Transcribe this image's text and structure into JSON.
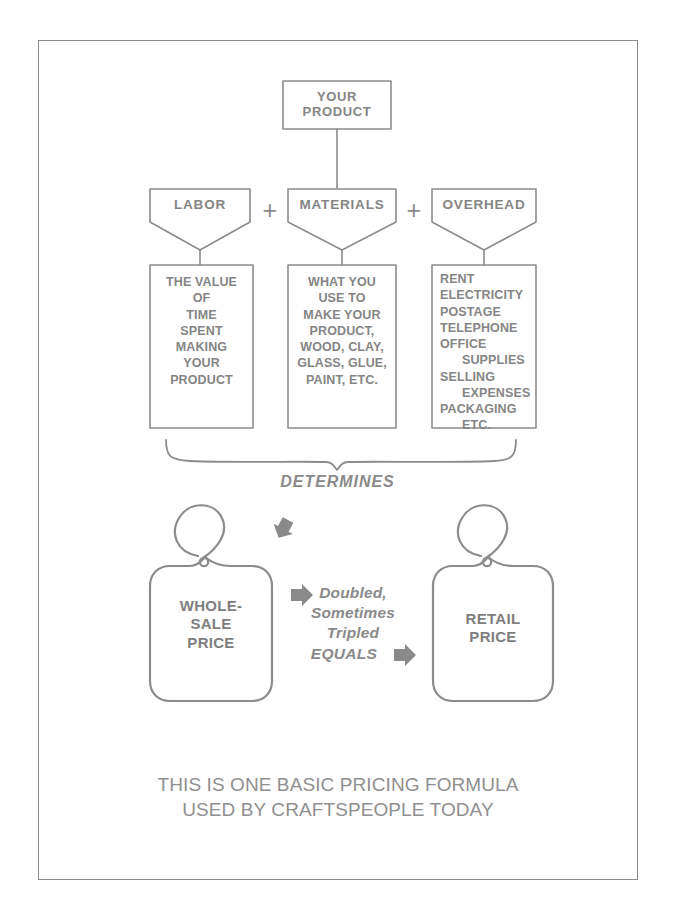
{
  "diagram": {
    "title_box": {
      "label": "YOUR\nPRODUCT",
      "line1": "YOUR",
      "line2": "PRODUCT"
    },
    "operators": {
      "plus1": "+",
      "plus2": "+"
    },
    "categories": [
      {
        "name": "LABOR",
        "detail_lines": [
          "THE VALUE",
          "OF",
          "TIME",
          "SPENT",
          "MAKING",
          "YOUR",
          "PRODUCT"
        ],
        "align": "center"
      },
      {
        "name": "MATERIALS",
        "detail_lines": [
          "WHAT YOU",
          "USE TO",
          "MAKE YOUR",
          "PRODUCT,",
          "WOOD, CLAY,",
          "GLASS, GLUE,",
          "PAINT, ETC."
        ],
        "align": "center"
      },
      {
        "name": "OVERHEAD",
        "detail_lines": [
          "RENT",
          "ELECTRICITY",
          "POSTAGE",
          "TELEPHONE",
          "OFFICE",
          "   SUPPLIES",
          "SELLING",
          "   EXPENSES",
          "PACKAGING",
          "   ETC."
        ],
        "align": "left"
      }
    ],
    "brace_label": "DETERMINES",
    "wholesale_tag": {
      "line1": "WHOLE-",
      "line2": "SALE",
      "line3": "PRICE"
    },
    "retail_tag": {
      "line1": "RETAIL",
      "line2": "PRICE"
    },
    "middle_note": {
      "line1": "Doubled,",
      "line2": "Sometimes",
      "line3": "Tripled",
      "equals": "EQUALS"
    },
    "caption": {
      "line1": "THIS IS ONE BASIC PRICING FORMULA",
      "line2": "USED BY CRAFTSPEOPLE TODAY"
    },
    "colors": {
      "stroke": "#8c8c8c",
      "text": "#858585",
      "arrow": "#8a8a8a",
      "background": "#ffffff"
    }
  }
}
